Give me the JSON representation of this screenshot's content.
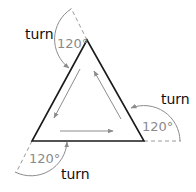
{
  "diagram": {
    "type": "exterior-angles-of-equilateral-triangle",
    "colors": {
      "triangle": "#1a1a1a",
      "arcs": "#8c8c8c",
      "inner_arrows": "#8c8c8c",
      "dashed": "#9a9a9a",
      "turn_text": "#111111",
      "angle_text": "#8a8a8a"
    },
    "vertices": [
      {
        "name": "top",
        "x": 87,
        "y": 40
      },
      {
        "name": "bottom-left",
        "x": 32,
        "y": 141
      },
      {
        "name": "bottom-right",
        "x": 144,
        "y": 141
      }
    ],
    "corners": [
      {
        "id": "top",
        "turn_label": "turn",
        "angle_label": "120°"
      },
      {
        "id": "right",
        "turn_label": "turn",
        "angle_label": "120°"
      },
      {
        "id": "bottom",
        "turn_label": "turn",
        "angle_label": "120°"
      }
    ],
    "inner_arrows": [
      {
        "edge": "left",
        "direction": "down"
      },
      {
        "edge": "bottom",
        "direction": "right"
      },
      {
        "edge": "right",
        "direction": "up"
      }
    ]
  }
}
